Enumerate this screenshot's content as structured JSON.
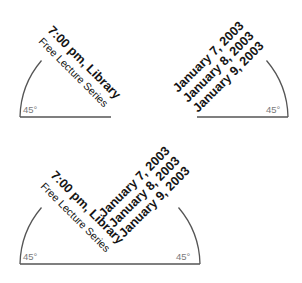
{
  "colors": {
    "text": "#141414",
    "guide_line": "#555555",
    "angle_label": "#7a7a7a",
    "background": "#ffffff"
  },
  "panels": [
    {
      "id": "top-left",
      "angle_label": "45°",
      "event": {
        "time_location": "7:00 pm, Library",
        "series": "Free Lecture Series"
      }
    },
    {
      "id": "top-right",
      "angle_label": "45°",
      "dates": [
        "January 7, 2003",
        "January 8, 2003",
        "January 9, 2003"
      ]
    },
    {
      "id": "bottom-combined",
      "angle_labels": [
        "45°",
        "45°"
      ],
      "event": {
        "time_location": "7:00 pm, Library",
        "series": "Free Lecture Series"
      },
      "dates": [
        "January 7, 2003",
        "January 8, 2003",
        "January 9, 2003"
      ]
    }
  ]
}
